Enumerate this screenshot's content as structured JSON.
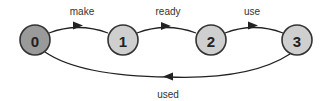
{
  "diagram": {
    "type": "state-machine",
    "colors": {
      "start_node_fill": "#9a9a9a",
      "node_fill": "#cfcfcf",
      "stroke": "#333333",
      "background": "#ffffff"
    },
    "nodes": [
      {
        "id": "0",
        "label": "0",
        "initial": true
      },
      {
        "id": "1",
        "label": "1"
      },
      {
        "id": "2",
        "label": "2"
      },
      {
        "id": "3",
        "label": "3"
      }
    ],
    "edges": [
      {
        "from": "0",
        "to": "1",
        "label": "make"
      },
      {
        "from": "1",
        "to": "2",
        "label": "ready"
      },
      {
        "from": "2",
        "to": "3",
        "label": "use"
      },
      {
        "from": "3",
        "to": "0",
        "label": "used"
      }
    ]
  }
}
